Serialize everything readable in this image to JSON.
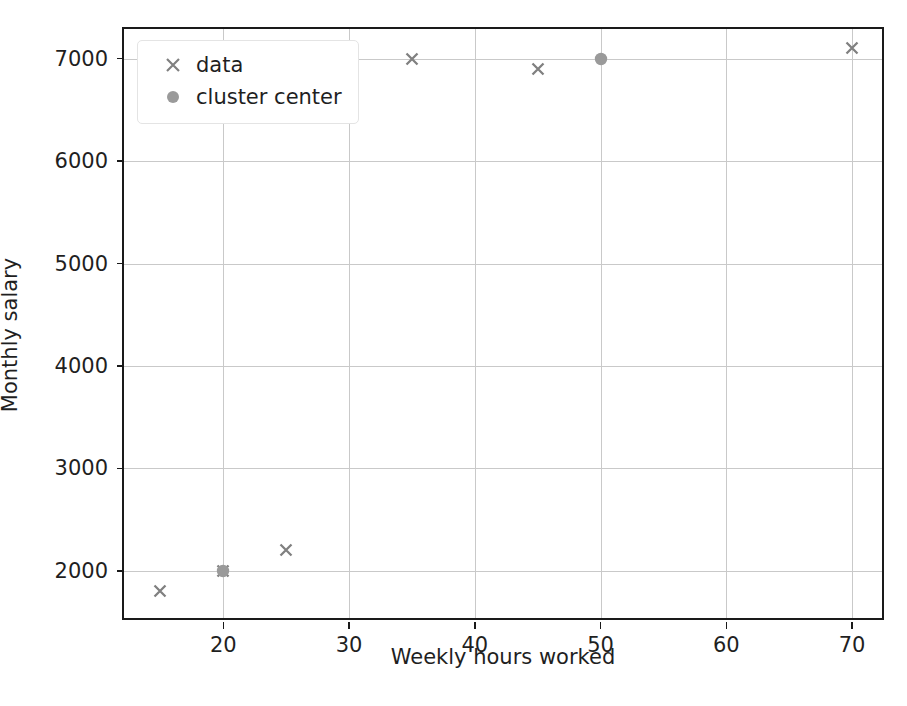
{
  "chart_data": {
    "type": "scatter",
    "title": "",
    "xlabel": "Weekly hours worked",
    "ylabel": "Monthly salary",
    "xlim": [
      12.1,
      72.7
    ],
    "ylim": [
      1500,
      7290
    ],
    "xticks": [
      20,
      30,
      40,
      50,
      60,
      70
    ],
    "yticks": [
      2000,
      3000,
      4000,
      5000,
      6000,
      7000
    ],
    "xticklabels": [
      "20",
      "30",
      "40",
      "50",
      "60",
      "70"
    ],
    "yticklabels": [
      "2000",
      "3000",
      "4000",
      "5000",
      "6000",
      "7000"
    ],
    "grid": true,
    "legend_position": "upper left",
    "marker_color": "#808080",
    "grid_color": "#c9c9c9",
    "axes_color": "#1a1a1a",
    "background_color": "#ffffff",
    "series": [
      {
        "name": "data",
        "marker": "x",
        "color": "#808080",
        "points": [
          {
            "x": 15,
            "y": 1800
          },
          {
            "x": 20,
            "y": 2000
          },
          {
            "x": 25,
            "y": 2200
          },
          {
            "x": 35,
            "y": 7000
          },
          {
            "x": 45,
            "y": 6900
          },
          {
            "x": 70,
            "y": 7100
          }
        ]
      },
      {
        "name": "cluster center",
        "marker": "o",
        "color": "#808080",
        "points": [
          {
            "x": 20,
            "y": 2000
          },
          {
            "x": 50,
            "y": 7000
          }
        ]
      }
    ]
  },
  "legend": {
    "entries": [
      {
        "label": "data",
        "marker": "x-marker-icon"
      },
      {
        "label": "cluster center",
        "marker": "circle-marker-icon"
      }
    ]
  }
}
